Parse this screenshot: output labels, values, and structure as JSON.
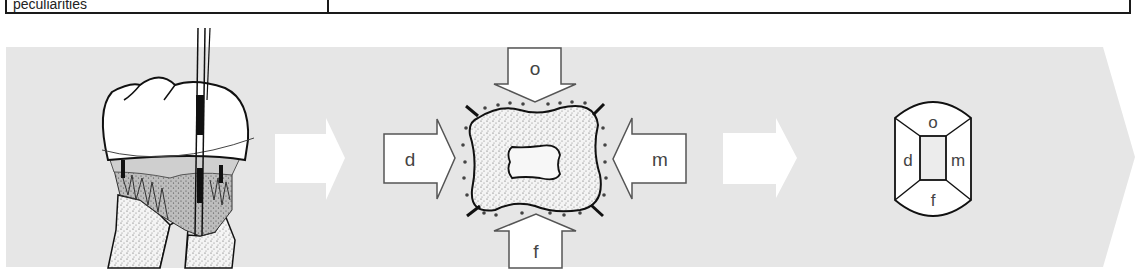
{
  "table": {
    "left_cell_text": "peculiarities",
    "right_cell_text": ""
  },
  "diagram": {
    "background_band_color": "#e6e6e6",
    "step1": {
      "description": "molar tooth with periodontal probe and stippled bone loss"
    },
    "step2": {
      "description": "cross-section of root with directional arrows",
      "arrows": {
        "top": "o",
        "left": "d",
        "right": "m",
        "bottom": "f"
      }
    },
    "step3": {
      "description": "schematic root surface map",
      "labels": {
        "top": "o",
        "left": "d",
        "right": "m",
        "bottom": "f"
      }
    }
  }
}
